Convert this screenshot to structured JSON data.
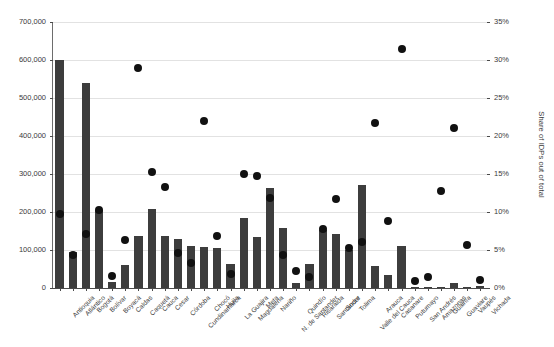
{
  "chart_data": {
    "type": "bar",
    "title": "",
    "xlabel": "",
    "ylabel": "Total IDPs",
    "y2label": "Share of IDPs out of total",
    "ylim": [
      0,
      700000
    ],
    "y2lim": [
      0,
      0.35
    ],
    "grid": true,
    "legend": "none",
    "y_ticks": [
      "0",
      "100,000",
      "200,000",
      "300,000",
      "400,000",
      "500,000",
      "600,000",
      "700,000"
    ],
    "y_tick_values": [
      0,
      100000,
      200000,
      300000,
      400000,
      500000,
      600000,
      700000
    ],
    "y2_ticks": [
      "0%",
      "5%",
      "10%",
      "15%",
      "20%",
      "25%",
      "30%",
      "35%"
    ],
    "y2_tick_values": [
      0,
      5,
      10,
      15,
      20,
      25,
      30,
      35
    ],
    "categories": [
      "Antioquia",
      "Atlántico",
      "Bogotá",
      "Bolívar",
      "Boyacá",
      "Caldas",
      "Caquetá",
      "Cauca",
      "Cesar",
      "Córdoba",
      "Cundinamarca",
      "Chocó",
      "Huila",
      "La Guajira",
      "Magdalena",
      "Meta",
      "Nariño",
      "N. de Santander",
      "Quindío",
      "Risaralda",
      "Santander",
      "Sucre",
      "Tolima",
      "Valle del Cauca",
      "Arauca",
      "Casanare",
      "Putumayo",
      "San Andrés",
      "Amazonas",
      "Guainía",
      "Guaviare",
      "Vaupés",
      "Vichada"
    ],
    "series": [
      {
        "name": "Total IDPs",
        "axis": "left",
        "mark": "bar",
        "color": "#3d3d3d",
        "values": [
          600000,
          96000,
          540000,
          205000,
          17000,
          60000,
          137000,
          207000,
          138000,
          130000,
          110000,
          108000,
          106000,
          62000,
          183000,
          134000,
          262000,
          159000,
          13000,
          63000,
          152000,
          143000,
          101000,
          272000,
          58000,
          33000,
          110000,
          2000,
          3000,
          1500,
          12000,
          2500,
          4000
        ]
      },
      {
        "name": "Share of IDPs out of total",
        "axis": "right",
        "mark": "dot",
        "color": "#111111",
        "values": [
          9.8,
          4.3,
          7.1,
          10.2,
          1.6,
          6.3,
          29.0,
          15.3,
          13.3,
          4.6,
          3.3,
          22.0,
          6.9,
          1.9,
          15.0,
          14.8,
          11.8,
          4.4,
          2.2,
          1.5,
          7.7,
          11.7,
          5.2,
          6.1,
          21.7,
          8.8,
          31.4,
          0.9,
          1.5,
          12.7,
          21.1,
          5.6,
          1.0
        ]
      }
    ]
  }
}
